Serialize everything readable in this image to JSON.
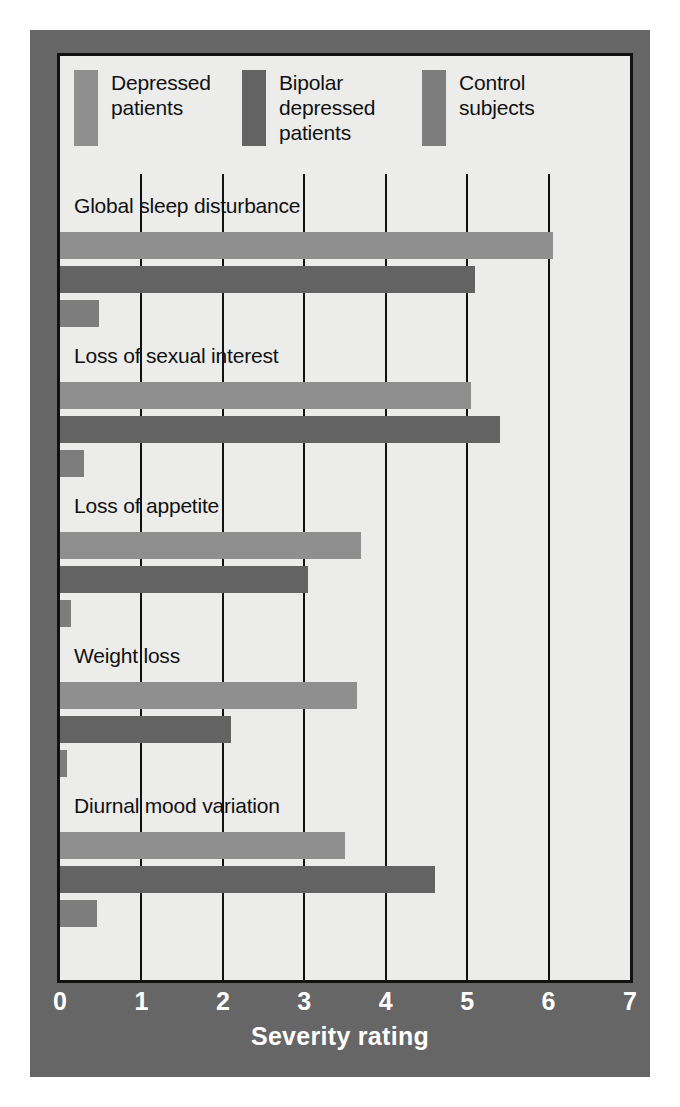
{
  "chart_data": {
    "type": "bar",
    "orientation": "horizontal",
    "title": "",
    "xlabel": "Severity rating",
    "ylabel": "",
    "xlim": [
      0,
      7
    ],
    "xticks": [
      "0",
      "1",
      "2",
      "3",
      "4",
      "5",
      "6",
      "7"
    ],
    "grid": true,
    "legend_position": "top-inside",
    "categories": [
      "Global sleep disturbance",
      "Loss of sexual interest",
      "Loss of appetite",
      "Weight loss",
      "Diurnal mood variation"
    ],
    "series": [
      {
        "name": "Depressed patients",
        "color": "#8f8f8f",
        "values": [
          6.05,
          5.05,
          3.7,
          3.65,
          3.5
        ]
      },
      {
        "name": "Bipolar depressed patients",
        "color": "#636363",
        "values": [
          5.1,
          5.4,
          3.05,
          2.1,
          4.6
        ]
      },
      {
        "name": "Control subjects",
        "color": "#7d7d7d",
        "values": [
          0.48,
          0.3,
          0.13,
          0.09,
          0.45
        ]
      }
    ]
  },
  "legend": {
    "items": [
      {
        "label": "Depressed\npatients",
        "swatch_color": "#8f8f8f"
      },
      {
        "label": "Bipolar\ndepressed\npatients",
        "swatch_color": "#636363"
      },
      {
        "label": "Control\nsubjects",
        "swatch_color": "#7d7d7d"
      }
    ]
  },
  "figure": {
    "frame_color": "#666666",
    "panel_color": "#ececeb",
    "border_color": "#111111",
    "tick_text_color": "#ffffff"
  }
}
